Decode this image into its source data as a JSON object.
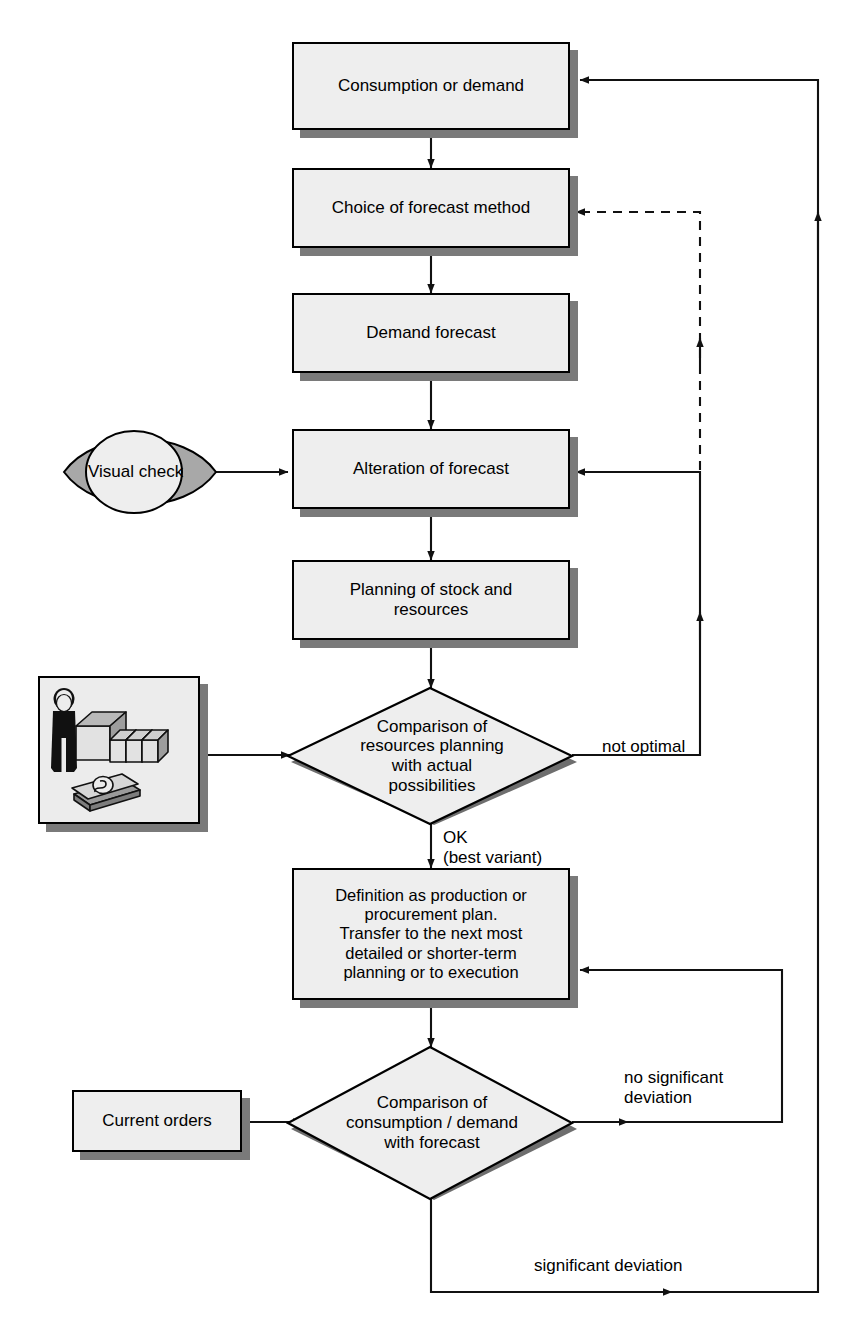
{
  "diagram": {
    "type": "flowchart",
    "colors": {
      "node_fill": "#eeeeee",
      "node_border": "#000000",
      "shadow": "#7a7a7a",
      "eye_lens": "#a8a8a8",
      "eye_iris": "#eeeeee",
      "page_background": "#ffffff"
    }
  },
  "nodes": {
    "consumption": {
      "label": "Consumption or demand",
      "shape": "process"
    },
    "choice": {
      "label": "Choice of forecast method",
      "shape": "process"
    },
    "forecast": {
      "label": "Demand forecast",
      "shape": "process"
    },
    "alteration": {
      "label": "Alteration of forecast",
      "shape": "process"
    },
    "planning": {
      "label": "Planning of stock and\nresources",
      "shape": "process"
    },
    "compare_resources": {
      "label": "Comparison of\nresources planning\nwith actual\npossibilities",
      "shape": "decision"
    },
    "definition": {
      "label": "Definition as production or\nprocurement plan.\nTransfer to the next most\ndetailed or shorter-term\nplanning or to execution",
      "shape": "process"
    },
    "compare_consumption": {
      "label": "Comparison of\nconsumption / demand\nwith forecast",
      "shape": "decision"
    },
    "visual_check": {
      "label": "Visual check",
      "shape": "eye"
    },
    "current_orders": {
      "label": "Current orders",
      "shape": "process"
    },
    "resources_picture": {
      "label": "",
      "shape": "picture",
      "icons": [
        "person-icon",
        "factory-buildings-icon",
        "banknotes-icon"
      ]
    }
  },
  "edge_labels": {
    "not_optimal": "not optimal",
    "ok_best_variant": "OK\n(best variant)",
    "no_significant_deviation": "no significant\ndeviation",
    "significant_deviation": "significant deviation"
  },
  "edges": [
    {
      "from": "consumption",
      "to": "choice",
      "style": "solid"
    },
    {
      "from": "choice",
      "to": "forecast",
      "style": "solid"
    },
    {
      "from": "forecast",
      "to": "alteration",
      "style": "solid"
    },
    {
      "from": "visual_check",
      "to": "alteration",
      "style": "solid"
    },
    {
      "from": "alteration",
      "to": "planning",
      "style": "solid"
    },
    {
      "from": "planning",
      "to": "compare_resources",
      "style": "solid"
    },
    {
      "from": "resources_picture",
      "to": "compare_resources",
      "style": "solid"
    },
    {
      "from": "compare_resources",
      "to": "alteration",
      "style": "solid",
      "label": "not optimal"
    },
    {
      "from": "alteration",
      "to": "choice",
      "style": "dashed"
    },
    {
      "from": "compare_resources",
      "to": "definition",
      "style": "solid",
      "label": "OK\n(best variant)"
    },
    {
      "from": "definition",
      "to": "compare_consumption",
      "style": "solid"
    },
    {
      "from": "current_orders",
      "to": "compare_consumption",
      "style": "solid"
    },
    {
      "from": "compare_consumption",
      "to": "definition",
      "style": "solid",
      "label": "no significant\ndeviation"
    },
    {
      "from": "compare_consumption",
      "to": "consumption",
      "style": "solid",
      "label": "significant deviation"
    }
  ]
}
